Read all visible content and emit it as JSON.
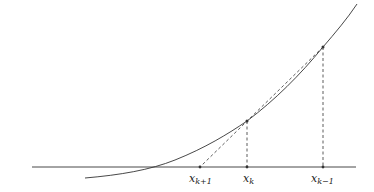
{
  "diagram": {
    "title": "",
    "colors": {
      "curve": "#333333",
      "axis": "#333333",
      "dashed": "#333333",
      "text": "#222222",
      "background": "#ffffff"
    },
    "axis": {
      "x1": 32,
      "x2": 356,
      "y": 167
    },
    "curve_path": "M 85 178 C 120 175, 150 170, 175 160 C 205 148, 228 134, 247 121 C 275 100, 300 75, 323 47 C 335 33, 347 19, 357 4",
    "points": [
      {
        "id": "x_k_minus_1",
        "x": 323,
        "curve_y": 47,
        "label_main": "x",
        "label_sub": "k−1",
        "label_x": 311
      },
      {
        "id": "x_k",
        "x": 247,
        "curve_y": 121,
        "label_main": "x",
        "label_sub": "k",
        "label_x": 243
      },
      {
        "id": "x_k_plus_1",
        "x": 200,
        "curve_y": null,
        "label_main": "x",
        "label_sub": "k+1",
        "label_x": 189
      }
    ],
    "secant": {
      "x1": 323,
      "y1": 47,
      "x2": 200,
      "y2": 167
    }
  }
}
